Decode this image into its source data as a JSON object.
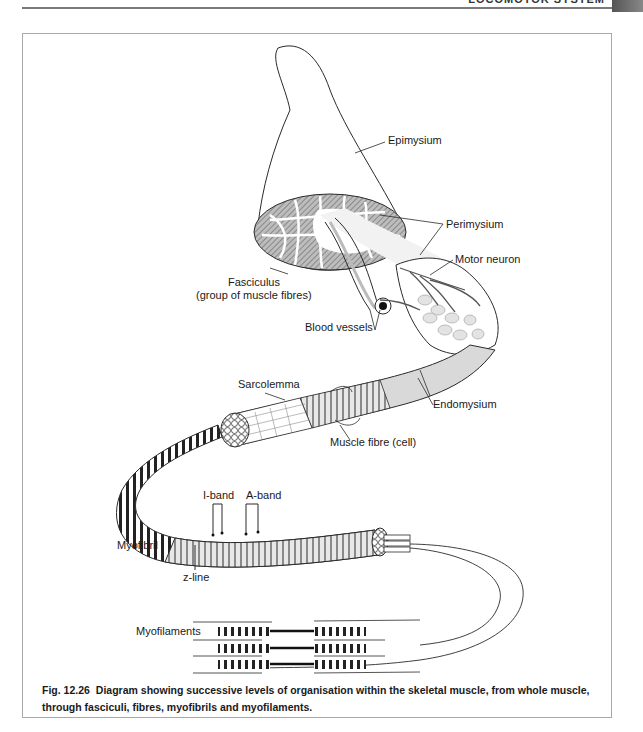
{
  "page": {
    "running_header": "LOCOMOTOR SYSTEM"
  },
  "figure": {
    "number": "Fig. 12.26",
    "caption": "Diagram showing successive levels of organisation within the skeletal muscle, from whole muscle, through fasciculi, fibres, myofibrils and myofilaments."
  },
  "labels": {
    "epimysium": "Epimysium",
    "perimysium": "Perimysium",
    "motor_neuron": "Motor neuron",
    "fasciculus": "Fasciculus",
    "fasciculus_note": "(group of muscle fibres)",
    "blood_vessels": "Blood vessels",
    "sarcolemma": "Sarcolemma",
    "endomysium": "Endomysium",
    "muscle_fibre": "Muscle fibre (cell)",
    "i_band": "I-band",
    "a_band": "A-band",
    "myofibril": "Myofibril",
    "z_line": "z-line",
    "myofilaments": "Myofilaments"
  },
  "colors": {
    "line": "#2a2a2a",
    "hatch": "#6e6e6e",
    "fibre_fill": "#d6d6d6",
    "frame": "#a8a8a8"
  }
}
